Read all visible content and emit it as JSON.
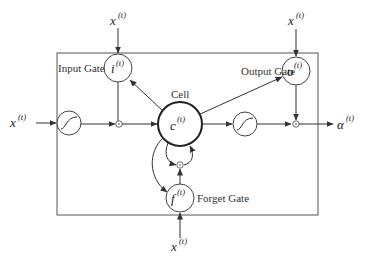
{
  "diagram": {
    "labels": {
      "input_gate": "Input Gate",
      "output_gate": "Output Gate",
      "forget_gate": "Forget Gate",
      "cell": "Cell"
    },
    "nodes": {
      "input_gate": {
        "base": "i",
        "sup": "(t)"
      },
      "output_gate": {
        "base": "o",
        "sup": "(t)"
      },
      "forget_gate": {
        "base": "f",
        "sup": "(t)"
      },
      "cell": {
        "base": "c",
        "sup": "(t)"
      }
    },
    "inputs": {
      "left": {
        "base": "x",
        "sup": "(t)"
      },
      "top_input_gate": {
        "base": "x",
        "sup": "(t)"
      },
      "top_output_gate": {
        "base": "x",
        "sup": "(t)"
      },
      "bottom_forget_gate": {
        "base": "x",
        "sup": "(t)"
      }
    },
    "output": {
      "base": "α",
      "sup": "(t)"
    },
    "colors": {
      "stroke": "#333333",
      "text": "#222222",
      "label": "#333333"
    }
  }
}
